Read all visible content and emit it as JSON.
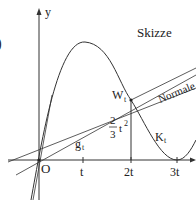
{
  "figure": {
    "title": "Skizze",
    "axis_y_label": "y",
    "origin_label": "O",
    "x_ticks": [
      "t",
      "2t",
      "3t"
    ],
    "curve_label": "K",
    "curve_label_sub": "t",
    "point_label": "W",
    "point_label_sub": "t",
    "line_label": "g",
    "line_label_sub": "t",
    "normal_label": "Normale",
    "height_fraction_num": "2",
    "height_fraction_den": "3",
    "height_expr": "t",
    "height_expr_exp": "2",
    "left_margin_glyph": ")"
  },
  "colors": {
    "line": "#333333",
    "text": "#222222",
    "background": "#ffffff"
  }
}
